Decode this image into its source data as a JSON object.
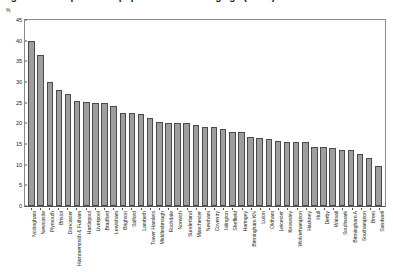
{
  "chart_data": {
    "type": "bar",
    "title": "Figure 4.2: Proportion of population of working age (16-64)",
    "subtitle": "",
    "xlabel": "",
    "ylabel": "%",
    "ylim": [
      0,
      45
    ],
    "yticks": [
      0,
      5,
      10,
      15,
      20,
      25,
      30,
      35,
      40,
      45
    ],
    "ytick_labels": [
      "0",
      "5",
      "10",
      "15",
      "20",
      "25",
      "30",
      "35",
      "40",
      "45"
    ],
    "grid": false,
    "legend": null,
    "bar_color": "#9e9e9e",
    "bar_edge_color": "#4a4a4a",
    "categories": [
      "Nottingham",
      "Newcastle",
      "Plymouth",
      "Bristol",
      "Doncaster",
      "Hammersmith & Fulham",
      "Hartlepool",
      "Liverpool",
      "Bradford",
      "Lewisham",
      "Brighton",
      "Salford",
      "Lambeth",
      "Tower Hamlets",
      "Middlesbrough",
      "Rochdale",
      "Norwich",
      "Sunderland",
      "Manchester",
      "Newham",
      "Coventry",
      "Islington",
      "Sheffield",
      "Haringey",
      "Birmingham KN",
      "Luton",
      "Oldham",
      "Leicester",
      "Knowsley",
      "Wolverhampton",
      "Hackney",
      "Hull",
      "Derby",
      "Walsall",
      "Southwark",
      "Birmingham A",
      "Southampton",
      "Brent",
      "Sandwell"
    ],
    "values": [
      40.0,
      36.5,
      30.0,
      28.0,
      27.0,
      25.5,
      25.2,
      25.0,
      25.0,
      24.2,
      22.6,
      22.5,
      22.2,
      21.3,
      20.4,
      20.0,
      20.0,
      20.0,
      19.5,
      19.2,
      19.0,
      18.7,
      18.0,
      17.9,
      16.7,
      16.5,
      16.2,
      15.8,
      15.5,
      15.5,
      15.4,
      14.3,
      14.3,
      14.0,
      13.6,
      13.6,
      12.5,
      11.5,
      9.8
    ]
  }
}
